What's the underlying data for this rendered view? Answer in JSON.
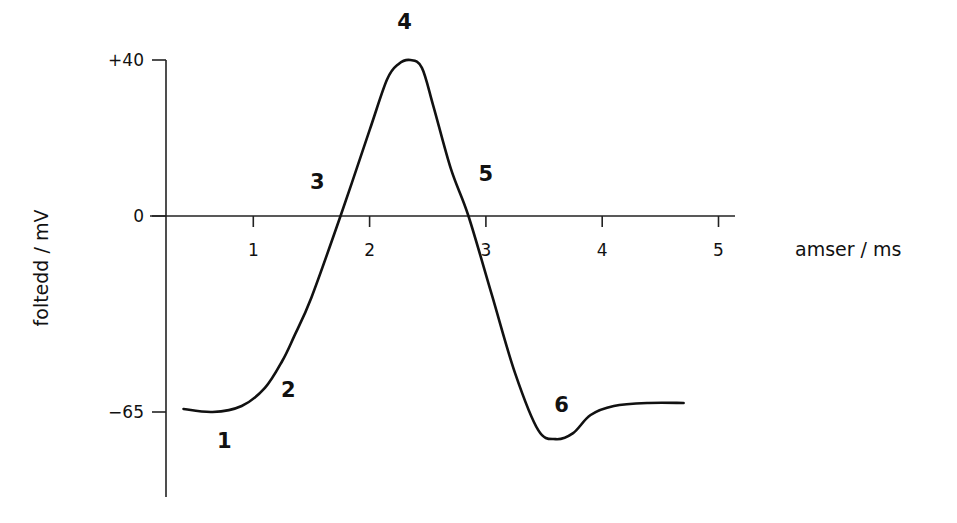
{
  "chart_data": {
    "type": "line",
    "title": "",
    "xlabel": "amser / ms",
    "ylabel": "foltedd / mV",
    "x_ticks": [
      1,
      2,
      3,
      4,
      5
    ],
    "x_tick_labels": [
      "1",
      "2",
      "3",
      "4",
      "5"
    ],
    "y_ticks": [
      40,
      0,
      -65
    ],
    "y_tick_labels": [
      "+40",
      "0",
      "−65"
    ],
    "xlim": [
      0.26,
      5.15
    ],
    "ylim": [
      -90,
      40
    ],
    "grid": false,
    "series": [
      {
        "name": "action potential",
        "x": [
          0.4,
          0.65,
          0.9,
          1.1,
          1.25,
          1.35,
          1.5,
          1.75,
          2.0,
          2.15,
          2.25,
          2.35,
          2.45,
          2.55,
          2.7,
          2.85,
          3.05,
          3.25,
          3.45,
          3.6,
          3.75,
          3.9,
          4.1,
          4.4,
          4.7
        ],
        "y": [
          -64,
          -65,
          -63,
          -57,
          -48,
          -40,
          -27,
          0,
          22,
          35,
          39,
          40,
          38,
          28,
          12,
          0,
          -26,
          -52,
          -71,
          -74,
          -72,
          -66,
          -63,
          -62,
          -62
        ]
      }
    ],
    "annotations": [
      {
        "label": "1",
        "x": 0.75,
        "y": -77
      },
      {
        "label": "2",
        "x": 1.3,
        "y": -60
      },
      {
        "label": "3",
        "x": 1.55,
        "y": 7
      },
      {
        "label": "4",
        "x": 2.3,
        "y": 48
      },
      {
        "label": "5",
        "x": 3.0,
        "y": 9
      },
      {
        "label": "6",
        "x": 3.65,
        "y": -65
      }
    ]
  }
}
